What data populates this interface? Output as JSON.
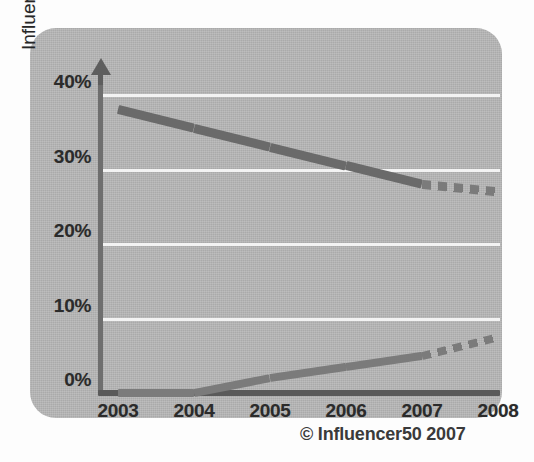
{
  "chart_data": {
    "type": "line",
    "title": "",
    "subtitle": "",
    "xlabel": "",
    "ylabel": "Influencers per tech market (average)",
    "x": [
      2003,
      2004,
      2005,
      2006,
      2007,
      2008
    ],
    "xtick_labels": [
      "2003",
      "2004",
      "2005",
      "2006",
      "2007",
      "2008"
    ],
    "ytick_labels": [
      "0%",
      "10%",
      "20%",
      "30%",
      "40%"
    ],
    "ytick_values": [
      0,
      10,
      20,
      30,
      40
    ],
    "ylim": [
      0,
      40
    ],
    "xlim": [
      2003,
      2008
    ],
    "grid": "horizontal",
    "grid_color": "#f3f3f3",
    "legend": "none",
    "annotation": "© Influencer50 2007",
    "series": [
      {
        "name": "declining-influencer-share",
        "values": [
          38,
          35.5,
          33,
          30.5,
          28,
          27
        ],
        "color": "#6a6a6a",
        "solid_until": 2007,
        "forecast_style": "dashed"
      },
      {
        "name": "rising-influencer-share",
        "values": [
          0,
          0,
          2,
          3.5,
          5,
          7.5
        ],
        "color": "#7b7b7b",
        "solid_until": 2007,
        "forecast_style": "dashed"
      }
    ]
  },
  "axis": {
    "y_title": "Influencers per tech market (average)",
    "y_ticks": [
      "40%",
      "30%",
      "20%",
      "10%",
      "0%"
    ],
    "x_ticks": [
      "2003",
      "2004",
      "2005",
      "2006",
      "2007",
      "2008"
    ],
    "arrow_icon": "up-arrow-icon"
  },
  "footer": {
    "copyright": "© Influencer50 2007"
  },
  "colors": {
    "panel": "#b8b8b8",
    "gridline": "#f3f3f3",
    "axis": "#5a5a5a",
    "series_solid": "#6a6a6a",
    "series_dash": "#7b7b7b",
    "text": "#2b2b2b"
  }
}
